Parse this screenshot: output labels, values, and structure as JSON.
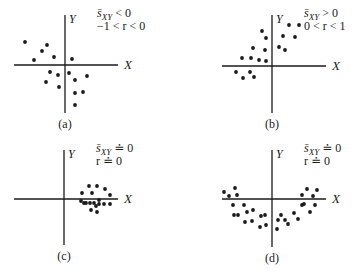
{
  "panels": [
    {
      "id": "a",
      "caption": "(a)",
      "x_axis_label": "X",
      "y_axis_label": "Y",
      "stat_line_1": {
        "symbol": "s̄",
        "subscript": "XY",
        "relation": " < 0"
      },
      "stat_line_2": "−1 < r < 0",
      "description": "negative covariance, moderate negative correlation",
      "axes": {
        "origin": [
          65,
          65
        ],
        "x_range": [
          14,
          118
        ],
        "y_range": [
          15,
          113
        ]
      },
      "points": [
        [
          25,
          42
        ],
        [
          47,
          45
        ],
        [
          42,
          51
        ],
        [
          54,
          57
        ],
        [
          34,
          60
        ],
        [
          72,
          59
        ],
        [
          50,
          72
        ],
        [
          58,
          75
        ],
        [
          69,
          73
        ],
        [
          87,
          76
        ],
        [
          46,
          82
        ],
        [
          75,
          80
        ],
        [
          59,
          87
        ],
        [
          83,
          92
        ],
        [
          75,
          93
        ],
        [
          75,
          105
        ]
      ]
    },
    {
      "id": "b",
      "caption": "(b)",
      "x_axis_label": "X",
      "y_axis_label": "Y",
      "stat_line_1": {
        "symbol": "s̄",
        "subscript": "XY",
        "relation": " > 0"
      },
      "stat_line_2": "0 < r < 1",
      "description": "positive covariance, moderate positive correlation",
      "axes": {
        "origin": [
          272,
          66
        ],
        "x_range": [
          222,
          326
        ],
        "y_range": [
          15,
          113
        ]
      },
      "points": [
        [
          262,
          31
        ],
        [
          266,
          38
        ],
        [
          289,
          25
        ],
        [
          299,
          25
        ],
        [
          283,
          36
        ],
        [
          295,
          37
        ],
        [
          253,
          48
        ],
        [
          265,
          50
        ],
        [
          279,
          47
        ],
        [
          285,
          50
        ],
        [
          242,
          58
        ],
        [
          251,
          58
        ],
        [
          259,
          60
        ],
        [
          266,
          61
        ],
        [
          236,
          72
        ],
        [
          243,
          78
        ],
        [
          250,
          72
        ],
        [
          254,
          77
        ]
      ]
    },
    {
      "id": "c",
      "caption": "(c)",
      "x_axis_label": "X",
      "y_axis_label": "Y",
      "stat_line_1": {
        "symbol": "s̄",
        "subscript": "XY",
        "relation": " ≐ 0"
      },
      "stat_line_2": "r ≐ 0",
      "description": "circular cluster, no correlation",
      "axes": {
        "origin": [
          64,
          199
        ],
        "x_range": [
          14,
          118
        ],
        "y_range": [
          150,
          245
        ]
      },
      "points": [
        [
          89,
          186
        ],
        [
          97,
          186
        ],
        [
          105,
          189
        ],
        [
          82,
          193
        ],
        [
          92,
          193
        ],
        [
          110,
          195
        ],
        [
          81,
          201
        ],
        [
          84,
          203
        ],
        [
          90,
          203
        ],
        [
          94,
          203
        ],
        [
          99,
          204
        ],
        [
          104,
          204
        ],
        [
          110,
          204
        ],
        [
          96,
          206
        ],
        [
          91,
          210
        ],
        [
          97,
          212
        ],
        [
          86,
          203
        ],
        [
          99,
          200
        ]
      ]
    },
    {
      "id": "d",
      "caption": "(d)",
      "x_axis_label": "X",
      "y_axis_label": "Y",
      "stat_line_1": {
        "symbol": "s̄",
        "subscript": "XY",
        "relation": " ≐ 0"
      },
      "stat_line_2": "r ≐ 0",
      "description": "U-shaped nonlinear relationship, no linear correlation",
      "axes": {
        "origin": [
          272,
          199
        ],
        "x_range": [
          222,
          326
        ],
        "y_range": [
          150,
          247
        ]
      },
      "points": [
        [
          224,
          192
        ],
        [
          229,
          196
        ],
        [
          235,
          188
        ],
        [
          237,
          195
        ],
        [
          233,
          205
        ],
        [
          244,
          205
        ],
        [
          234,
          215
        ],
        [
          238,
          215
        ],
        [
          247,
          212
        ],
        [
          253,
          210
        ],
        [
          245,
          222
        ],
        [
          252,
          221
        ],
        [
          261,
          216
        ],
        [
          265,
          215
        ],
        [
          260,
          227
        ],
        [
          266,
          225
        ],
        [
          277,
          229
        ],
        [
          278,
          220
        ],
        [
          281,
          215
        ],
        [
          285,
          220
        ],
        [
          288,
          224
        ],
        [
          294,
          213
        ],
        [
          298,
          219
        ],
        [
          302,
          205
        ],
        [
          304,
          204
        ],
        [
          302,
          195
        ],
        [
          307,
          189
        ],
        [
          313,
          196
        ],
        [
          317,
          190
        ],
        [
          310,
          212
        ],
        [
          315,
          205
        ]
      ]
    }
  ],
  "colors": {
    "ink": "#1a1a1a",
    "background": "#ffffff"
  }
}
